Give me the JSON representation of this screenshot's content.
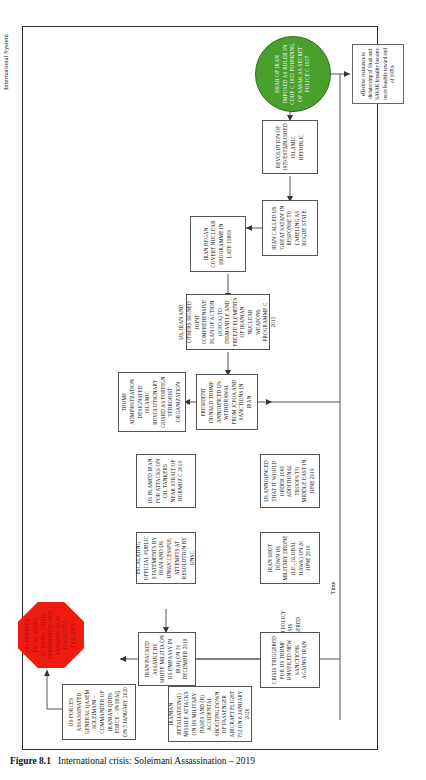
{
  "figure": {
    "number": "Figure 8.1",
    "title": "International crisis: Soleimani Assassination – 2019",
    "source_label": "International System",
    "time_axis_label": "Time"
  },
  "nodes": {
    "start": "Shah of Iran imposed as ruler in coup c 1953 Founding of SAVAK as secret police c 1957",
    "note": "effective resistance to dictatorship of Shah and SAVAK brutality became more feasible toward end of 1970s",
    "revolution": "Revolution of 1979 established Islamic Republic",
    "iran_called_great_satan": "Iran called US 'Great Satan' in response to labeling as rogue state",
    "iran_covert_nuclear": "Iran began covert nuclear programme in late 1980s",
    "jcpoa_signed": "US, Iran and others signed Joint Comprehensive Plan of Action (JCPOA) to dismantle and freeze elements of Iranian nuclear weapons programme c  2015",
    "trump_withdrawal": "President Donald Trump announced US withdrawal from JCPOA and sanctions in Iran",
    "irgc_terrorist": "Trump administration designated Islamic Revolutionary Guard as foreign terrorist organization",
    "oil_tankers": "US blamed Iran for attacks on oil tankers near Strait of Hormuz c  2019",
    "troops_middle_east": "US announced that it would order 1000 additional troops to Middle East in June 2019",
    "drone_shot_down": "Iran shot down US military drone (i.e., Global Hawk) on 20 June 2019",
    "foreign_policy_crisis": "Foreign policy crisis triggered",
    "crisis_sanctions": "Crisis triggered for US Trump unveiled new sanctions against Iran",
    "escalating_statements": "Escalating official public statements by Iran and US unsuccessful attempts at resolution by UNSC",
    "embassy_assault": "Iran backed assault by Shiite militia on US embassy in Iraq on 31 December 2019",
    "soleimani_killed": "US forces assassinated General Qasem Soleimani – commander of Iranian Quds Force – in Iraq on 3 January 2020",
    "iranian_retaliation": "Iranian retaliation (i) missile attacks on US military bases and (ii) accidental shooting down of passenger aircraft flight 752 on 8 January 2020",
    "stop": "No further escalatory actions: crisis terminated on 8 January as it flight 752 tragedy"
  },
  "colors": {
    "start_fill": "#49a02c",
    "stop_fill": "#ee1b11",
    "node_border": "#555555",
    "frame": "#2b2b2b"
  }
}
